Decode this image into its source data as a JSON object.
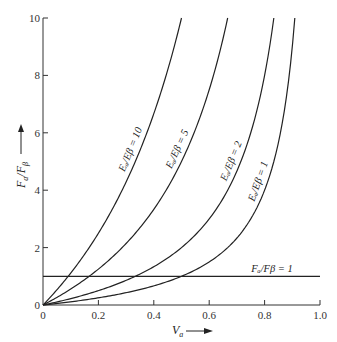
{
  "chart_data": {
    "type": "line",
    "title": "",
    "xlabel": "V_a",
    "ylabel": "F_a/F_β",
    "xlim": [
      0,
      1.0
    ],
    "ylim": [
      0,
      10
    ],
    "grid": false,
    "legend": "inline curve labels",
    "x_ticks": [
      "0",
      "0.2",
      "0.4",
      "0.6",
      "0.8",
      "1.0"
    ],
    "y_ticks": [
      "0",
      "2",
      "4",
      "6",
      "8",
      "10"
    ],
    "formula": "F_a/F_β = (E_a/E_β) · V_a / (1 − V_a)",
    "series": [
      {
        "name": "E_a/E_β = 10",
        "ratio": 10,
        "x": [
          0,
          0.05,
          0.1,
          0.2,
          0.3,
          0.4,
          0.5
        ],
        "y": [
          0,
          0.53,
          1.11,
          2.5,
          4.29,
          6.67,
          10.0
        ]
      },
      {
        "name": "E_a/E_β = 5",
        "ratio": 5,
        "x": [
          0,
          0.1,
          0.2,
          0.3,
          0.4,
          0.5,
          0.6,
          0.667
        ],
        "y": [
          0,
          0.56,
          1.25,
          2.14,
          3.33,
          5.0,
          7.5,
          10.0
        ]
      },
      {
        "name": "E_a/E_β = 2",
        "ratio": 2,
        "x": [
          0,
          0.1,
          0.2,
          0.3,
          0.4,
          0.5,
          0.6,
          0.7,
          0.8,
          0.833
        ],
        "y": [
          0,
          0.22,
          0.5,
          0.86,
          1.33,
          2.0,
          3.0,
          4.67,
          8.0,
          10.0
        ]
      },
      {
        "name": "E_a/E_β = 1",
        "ratio": 1,
        "x": [
          0,
          0.1,
          0.2,
          0.3,
          0.4,
          0.5,
          0.6,
          0.7,
          0.8,
          0.9,
          0.909
        ],
        "y": [
          0,
          0.11,
          0.25,
          0.43,
          0.67,
          1.0,
          1.5,
          2.33,
          4.0,
          9.0,
          10.0
        ]
      },
      {
        "name": "F_a/F_β = 1",
        "ratio": null,
        "x": [
          0,
          1.0
        ],
        "y": [
          1,
          1
        ]
      }
    ]
  },
  "labels": {
    "x_axis": "V",
    "x_axis_sub": "a",
    "y_axis_num": "F",
    "y_axis_num_sub": "a",
    "y_axis_den": "/F",
    "y_axis_den_sub": "β",
    "curve_10": "Eₐ/Eβ = 10",
    "curve_5": "Eₐ/Eβ = 5",
    "curve_2": "Eₐ/Eβ = 2",
    "curve_1": "Eₐ/Eβ = 1",
    "hline": "Fₐ/Fβ = 1"
  }
}
